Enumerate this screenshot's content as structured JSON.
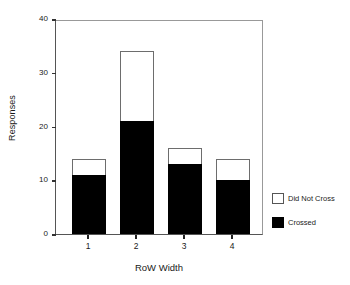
{
  "chart_data": {
    "type": "bar",
    "stacked": true,
    "title": "",
    "xlabel": "RoW Width",
    "ylabel": "Responses",
    "categories": [
      "1",
      "2",
      "3",
      "4"
    ],
    "series": [
      {
        "name": "Crossed",
        "color": "#000000",
        "values": [
          11,
          21,
          13,
          10
        ]
      },
      {
        "name": "Did Not Cross",
        "color": "#ffffff",
        "values": [
          3,
          13,
          3,
          4
        ]
      }
    ],
    "totals": [
      14,
      34,
      16,
      14
    ],
    "ylim": [
      0,
      40
    ],
    "yticks": [
      0,
      10,
      20,
      30,
      40
    ],
    "ytick_labels": [
      "0",
      "10",
      "20",
      "30",
      "40"
    ],
    "xtick_labels": [
      "1",
      "2",
      "3",
      "4"
    ],
    "grid": false,
    "legend_position": "right-bottom",
    "legend_entries": [
      {
        "label": "Did Not Cross",
        "swatch": "open"
      },
      {
        "label": "Crossed",
        "swatch": "filled"
      }
    ]
  }
}
